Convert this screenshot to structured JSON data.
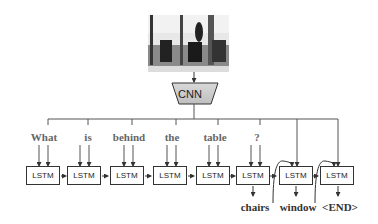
{
  "figure": {
    "encoder_label": "CNN",
    "cell_label": "LSTM",
    "question_words": [
      "What",
      "is",
      "behind",
      "the",
      "table",
      "?"
    ],
    "answer_words": [
      "chairs",
      "window",
      "<END>"
    ],
    "image_description": "photo of a room with chairs in front of a window"
  }
}
